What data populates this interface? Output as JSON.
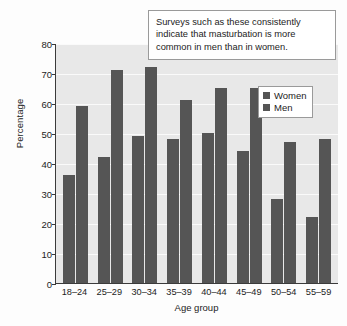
{
  "chart_data": {
    "type": "bar",
    "title": "",
    "xlabel": "Age group",
    "ylabel": "Percentage",
    "ylim": [
      0,
      80
    ],
    "yticks": [
      0,
      10,
      20,
      30,
      40,
      50,
      60,
      70,
      80
    ],
    "grid": true,
    "legend_position": "top-right-inside",
    "categories": [
      "18–24",
      "25–29",
      "30–34",
      "35–39",
      "40–44",
      "45–49",
      "50–54",
      "55–59"
    ],
    "series": [
      {
        "name": "Women",
        "values": [
          36,
          42,
          49,
          48,
          50,
          44,
          28,
          22
        ],
        "color": "#555555"
      },
      {
        "name": "Men",
        "values": [
          59,
          71,
          72,
          61,
          65,
          65,
          47,
          48
        ],
        "color": "#555555"
      }
    ],
    "annotations": [
      {
        "name": "survey-callout",
        "lines": [
          "Surveys such as these consistently",
          "indicate that masturbation is more",
          "common in men than in women."
        ]
      }
    ]
  },
  "colors": {
    "bar": "#555555",
    "plot_background": "#e8e8e8",
    "gridline": "#fafafa",
    "axis": "#3b3b3b",
    "text": "#1c1c1c",
    "page_background": "#fdfdfd"
  }
}
